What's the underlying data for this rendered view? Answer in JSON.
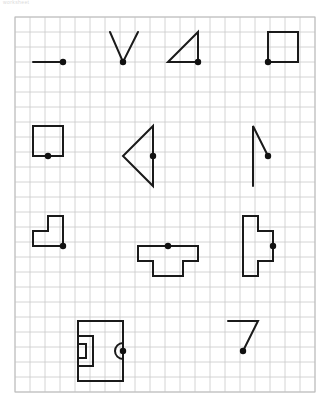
{
  "page": {
    "watermark": "worksheet",
    "background_color": "#ffffff"
  },
  "grid": {
    "x": 15,
    "y": 17,
    "cell": 15,
    "cols": 20,
    "rows": 25,
    "width": 295,
    "height": 376,
    "line_color": "#c9c9c9",
    "border_color": "#bdbdbd",
    "line_width": 0.8
  },
  "style": {
    "stroke_color": "#1a1a1a",
    "stroke_width": 2,
    "dot_color": "#111111",
    "dot_radius": 3.2
  },
  "shapes": [
    {
      "name": "horizontal-segment",
      "row": 1,
      "column": 1,
      "type": "polyline",
      "points": "33,62 63,62",
      "dot": {
        "x": 63,
        "y": 62
      }
    },
    {
      "name": "v-shape",
      "row": 1,
      "column": 2,
      "type": "polyline",
      "points": "110,32 123,62 138,32",
      "dot": {
        "x": 123,
        "y": 62
      }
    },
    {
      "name": "right-triangle",
      "row": 1,
      "column": 3,
      "type": "polygon",
      "points": "168,62 198,32 198,62",
      "dot": {
        "x": 198,
        "y": 62
      }
    },
    {
      "name": "square",
      "row": 1,
      "column": 4,
      "type": "polygon",
      "points": "268,32 298,32 298,62 268,62",
      "dot": {
        "x": 268,
        "y": 62
      }
    },
    {
      "name": "square-bottom-center-dot",
      "row": 2,
      "column": 1,
      "type": "polygon",
      "points": "33,126 63,126 63,156 33,156",
      "dot": {
        "x": 48,
        "y": 156
      }
    },
    {
      "name": "left-pointing-triangle",
      "row": 2,
      "column": 2,
      "type": "polygon",
      "points": "153,126 123,156 153,186",
      "dot": {
        "x": 153,
        "y": 156
      }
    },
    {
      "name": "vertical-line-with-diagonal",
      "row": 2,
      "column": 4,
      "type": "polyline",
      "points": "253,186 253,126 268,156",
      "dot": {
        "x": 268,
        "y": 156
      }
    },
    {
      "name": "l-shape-polygon",
      "row": 3,
      "column": 1,
      "type": "polygon",
      "points": "33,231 48,231 48,216 63,216 63,246 33,246",
      "dot": {
        "x": 63,
        "y": 246
      }
    },
    {
      "name": "t-shape-polygon",
      "row": 3,
      "column": 2,
      "type": "polygon",
      "points": "138,246 198,246 198,261 183,261 183,276 153,276 153,261 138,261",
      "dot": {
        "x": 168,
        "y": 246
      }
    },
    {
      "name": "stepped-cross-polygon",
      "row": 3,
      "column": 4,
      "type": "polygon",
      "points": "243,216 258,216 258,231 273,231 273,261 258,261 258,276 243,276",
      "dot": {
        "x": 273,
        "y": 246
      }
    },
    {
      "name": "field-rectangle-with-arc",
      "row": 4,
      "column": 1,
      "type": "compound",
      "outer": "78,321 123,321 123,381 78,381",
      "inner_box": "78,336 93,336 93,366 78,366",
      "inner_small_box": "78,344 86,344 86,358 78,358",
      "arc": {
        "cx": 123,
        "cy": 351,
        "r": 8,
        "side": "left"
      },
      "dot": {
        "x": 123,
        "y": 351
      }
    },
    {
      "name": "seven-shape",
      "row": 4,
      "column": 3,
      "type": "polyline",
      "points": "228,321 258,321 243,351",
      "dot": {
        "x": 243,
        "y": 351
      }
    }
  ]
}
